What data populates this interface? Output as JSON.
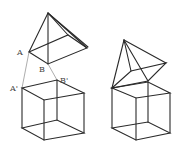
{
  "figure": {
    "colors": {
      "stroke": "#2a2a2a",
      "guide": "#8a8a8a",
      "label": "#444444",
      "background": "#ffffff"
    },
    "left": {
      "labels": {
        "A": "A",
        "B": "B",
        "A_prime": "A'",
        "B_prime": "B'"
      },
      "pyramid": {
        "apex": [
          48,
          13
        ],
        "base": [
          [
            29,
            52
          ],
          [
            68,
            35
          ],
          [
            87,
            48
          ],
          [
            48,
            64
          ]
        ]
      },
      "cube": {
        "top": [
          [
            22,
            88
          ],
          [
            57,
            80
          ],
          [
            84,
            93
          ],
          [
            44,
            100
          ]
        ],
        "bottom": [
          [
            22,
            128
          ],
          [
            57,
            120
          ],
          [
            84,
            133
          ],
          [
            44,
            140
          ]
        ]
      },
      "guides": [
        [
          [
            29,
            52
          ],
          [
            22,
            88
          ]
        ],
        [
          [
            48,
            64
          ],
          [
            57,
            80
          ]
        ]
      ]
    },
    "right": {
      "pyramid": {
        "apex": [
          124,
          40
        ],
        "base": [
          [
            112,
            88
          ],
          [
            131,
            71
          ],
          [
            166,
            63
          ],
          [
            148,
            81
          ]
        ]
      },
      "cube": {
        "top": [
          [
            112,
            88
          ],
          [
            148,
            82
          ],
          [
            170,
            93
          ],
          [
            136,
            98
          ]
        ],
        "bottom": [
          [
            112,
            128
          ],
          [
            148,
            122
          ],
          [
            170,
            133
          ],
          [
            136,
            140
          ]
        ]
      }
    }
  }
}
